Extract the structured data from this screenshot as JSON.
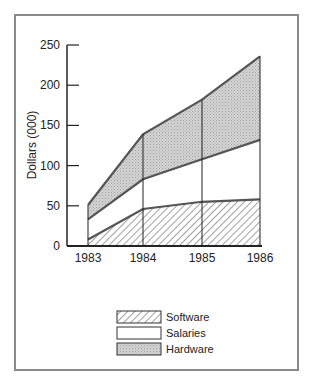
{
  "chart_data": {
    "type": "area",
    "stacked": true,
    "title": "",
    "xlabel": "",
    "ylabel": "Dollars (000)",
    "categories": [
      "1983",
      "1984",
      "1985",
      "1986"
    ],
    "series": [
      {
        "name": "Software",
        "values": [
          8,
          46,
          55,
          58
        ],
        "pattern": "diagonal-hatch"
      },
      {
        "name": "Salaries",
        "values": [
          25,
          37,
          53,
          74
        ],
        "pattern": "white",
        "cumulative_top": [
          33,
          83,
          108,
          132
        ]
      },
      {
        "name": "Hardware",
        "values": [
          18,
          56,
          74,
          104
        ],
        "pattern": "stipple-gray",
        "cumulative_top": [
          51,
          139,
          182,
          236
        ]
      }
    ],
    "ylim": [
      0,
      250
    ],
    "yticks": [
      0,
      50,
      100,
      150,
      200,
      250
    ],
    "grid": false,
    "legend_position": "bottom-center"
  },
  "axis": {
    "ylabel": "Dollars (000)",
    "yticks": [
      "0",
      "50",
      "100",
      "150",
      "200",
      "250"
    ],
    "xticks": [
      "1983",
      "1984",
      "1985",
      "1986"
    ]
  },
  "legend": {
    "items": [
      {
        "label": "Software"
      },
      {
        "label": "Salaries"
      },
      {
        "label": "Hardware"
      }
    ]
  },
  "colors": {
    "frame": "#8a8a8a",
    "line": "#555555",
    "stipple": "#cfcfcf"
  }
}
